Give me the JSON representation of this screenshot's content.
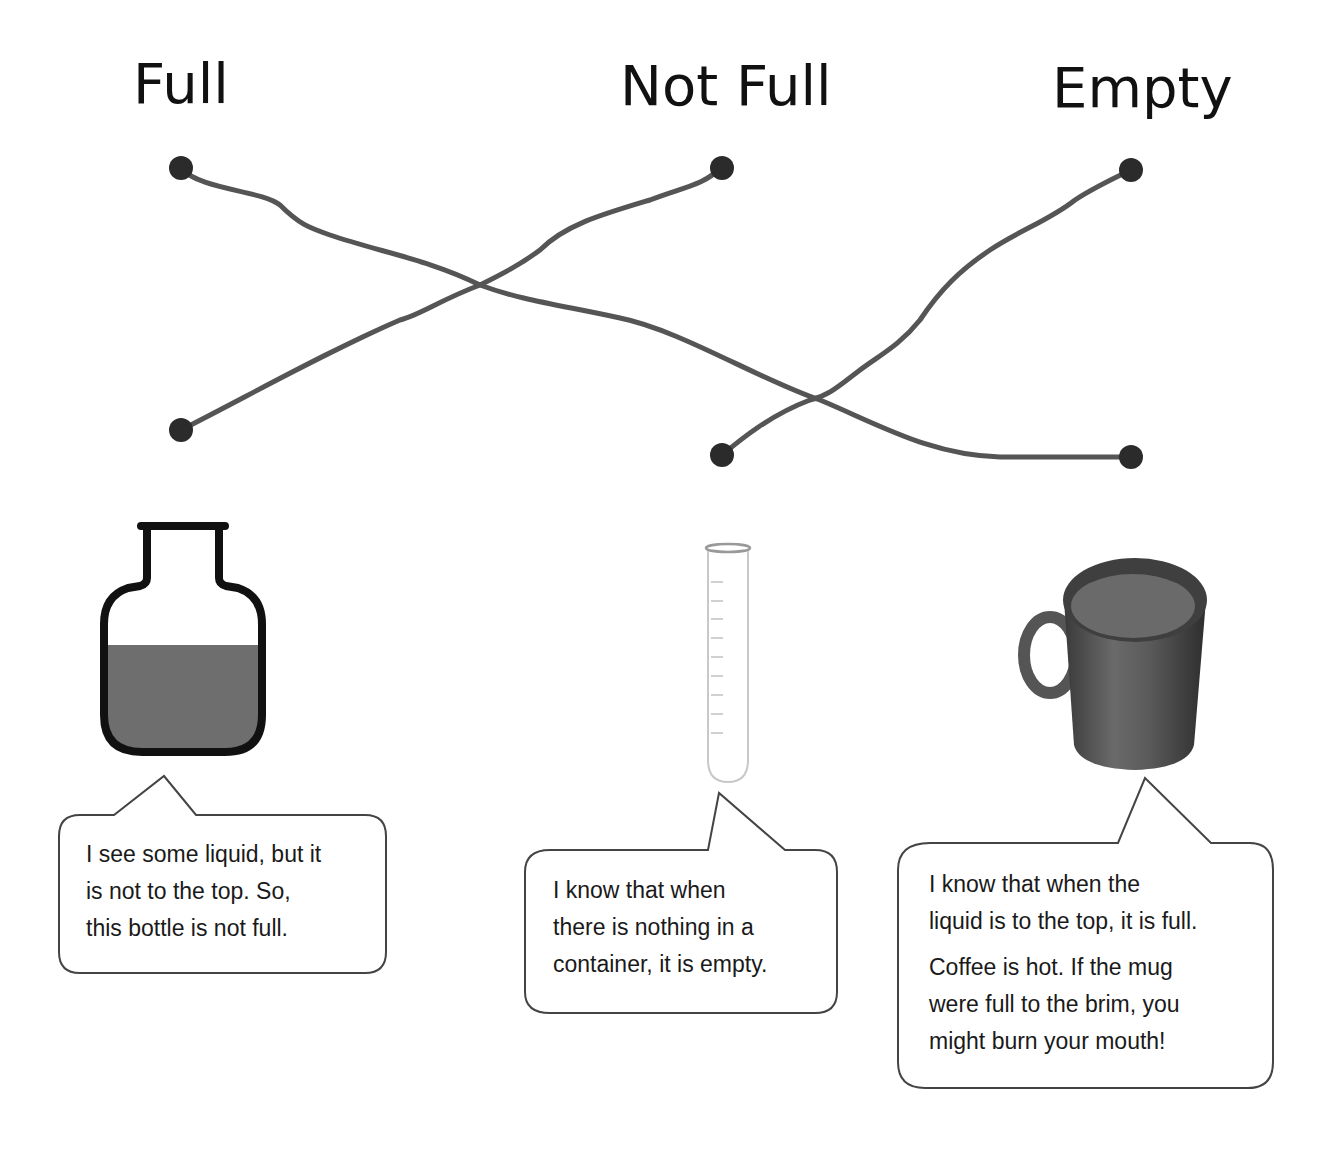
{
  "headings": {
    "full": "Full",
    "not_full": "Not Full",
    "empty": "Empty"
  },
  "connections": [
    {
      "from_heading": "Full",
      "to_item": "mug"
    },
    {
      "from_heading": "Not Full",
      "to_item": "bottle"
    },
    {
      "from_heading": "Empty",
      "to_item": "test-tube"
    }
  ],
  "items": [
    {
      "name": "bottle",
      "image": "bottle-icon",
      "bubble": "I see some liquid, but it\nis not to the top.  So,\nthis bottle is not full."
    },
    {
      "name": "test-tube",
      "image": "test-tube-icon",
      "bubble": "I know that when\nthere is nothing in a\ncontainer, it is empty."
    },
    {
      "name": "mug",
      "image": "coffee-mug-icon",
      "bubble": "I know that when the\nliquid is to the top, it is full.",
      "bubble_extra": "Coffee is hot.  If the mug\nwere full to the brim, you\nmight burn your mouth!"
    }
  ],
  "colors": {
    "line": "#555555",
    "dot": "#2b2b2b",
    "liquid": "#6e6e6e",
    "outline": "#111111"
  }
}
